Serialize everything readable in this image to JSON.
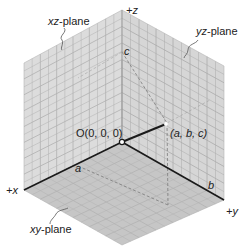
{
  "diagram": {
    "type": "3d-coordinate-system",
    "axes": {
      "x_label": "+x",
      "y_label": "+y",
      "z_label": "+z"
    },
    "planes": {
      "xz": "xz-plane",
      "yz": "yz-plane",
      "xy": "xy-plane"
    },
    "points": {
      "origin": "O(0, 0, 0)",
      "point": "(a, b, c)",
      "a": "a",
      "b": "b",
      "c": "c"
    },
    "colors": {
      "plane_fill": "#d9d9d9",
      "floor_fill": "#c4c4c4",
      "grid_line": "#a8a8a8",
      "axis": "#1a1a1a",
      "dashed": "#888888",
      "text": "#222222"
    }
  }
}
